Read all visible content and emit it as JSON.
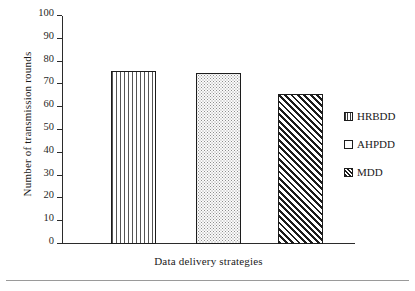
{
  "chart_data": {
    "type": "bar",
    "title": "",
    "xlabel": "Data delivery strategies",
    "ylabel": "Number of transmission rounds",
    "categories": [
      "HRBDD",
      "AHPDD",
      "MDD"
    ],
    "values": [
      76,
      75,
      66
    ],
    "ylim": [
      0,
      100
    ],
    "ytick_labels": [
      "100",
      "90",
      "80",
      "70",
      "60",
      "50",
      "40",
      "30",
      "20",
      "10",
      "0"
    ],
    "ytick_values": [
      100,
      90,
      80,
      70,
      60,
      50,
      40,
      30,
      20,
      10,
      0
    ],
    "xtick_labels": [],
    "grid": false,
    "legend_position": "right",
    "series": [
      {
        "name": "HRBDD",
        "value": 76,
        "pattern": "vertical-lines"
      },
      {
        "name": "AHPDD",
        "value": 75,
        "pattern": "dotted"
      },
      {
        "name": "MDD",
        "value": 66,
        "pattern": "diagonal-hatch"
      }
    ],
    "colors": {
      "axis": "#2b2b2b",
      "bar_outline": "#1c1c1c",
      "bar_fill": "#ffffff",
      "text": "#1a1a1a",
      "rule": "#9a9a9a"
    }
  },
  "legend": {
    "items": [
      {
        "label": "HRBDD"
      },
      {
        "label": "AHPDD"
      },
      {
        "label": "MDD"
      }
    ]
  }
}
